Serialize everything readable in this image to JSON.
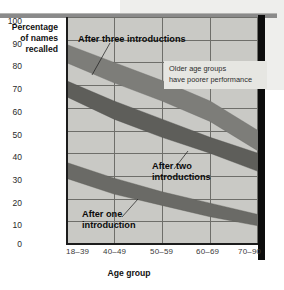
{
  "chart_data": {
    "type": "area",
    "title": "",
    "xlabel": "Age group",
    "ylabel": "Percentage of names recalled",
    "categories": [
      "18–39",
      "40–49",
      "50–59",
      "60–69",
      "70–90"
    ],
    "ylim": [
      0,
      100
    ],
    "yticks": [
      0,
      10,
      20,
      30,
      40,
      50,
      60,
      70,
      80,
      90,
      100
    ],
    "grid": true,
    "legend_position": "inline-callouts",
    "series": [
      {
        "name": "After three introductions",
        "upper": [
          88,
          80,
          72,
          63,
          50
        ],
        "lower": [
          80,
          71,
          63,
          54,
          41
        ],
        "values": [
          84,
          75.5,
          67.5,
          58.5,
          45.5
        ],
        "color": "#7d7d79"
      },
      {
        "name": "After two introductions",
        "upper": [
          72,
          63,
          55,
          47,
          40
        ],
        "lower": [
          65,
          55,
          47,
          40,
          32
        ],
        "values": [
          68.5,
          59,
          51,
          43.5,
          36
        ],
        "color": "#5e5e5a"
      },
      {
        "name": "After one introduction",
        "upper": [
          36,
          29,
          23,
          18,
          13
        ],
        "lower": [
          29,
          22,
          17,
          12,
          8
        ],
        "values": [
          32.5,
          25.5,
          20,
          15,
          10.5
        ],
        "color": "#6a6a66"
      }
    ],
    "annotations": [
      {
        "name": "older-age-groups-note",
        "lines": [
          "Older age groups",
          "have poorer performance"
        ]
      }
    ]
  },
  "axis": {
    "y_label_lines": [
      "Percentage",
      "of names",
      "recalled"
    ],
    "x_label": "Age group",
    "y_ticks": [
      "100",
      "90",
      "80",
      "70",
      "60",
      "50",
      "40",
      "30",
      "20",
      "10",
      "0"
    ],
    "x_ticks": [
      "18–39",
      "40–49",
      "50–59",
      "60–69",
      "70–90"
    ]
  },
  "labels": {
    "series_three": "After three introductions",
    "series_two_line1": "After two",
    "series_two_line2": "introductions",
    "series_one_line1": "After one",
    "series_one_line2": "introduction"
  },
  "annotation": {
    "line1": "Older age groups",
    "line2": "have poorer performance"
  },
  "colors": {
    "plot_background": "#c9c9c5",
    "grid": "#6e6e6a",
    "axis": "#1c1c1c",
    "band_three": "#7d7d79",
    "band_two": "#5e5e5a",
    "band_one": "#6a6a66",
    "page_panel": "#eeeeec",
    "right_bar": "#0d0d0d"
  }
}
